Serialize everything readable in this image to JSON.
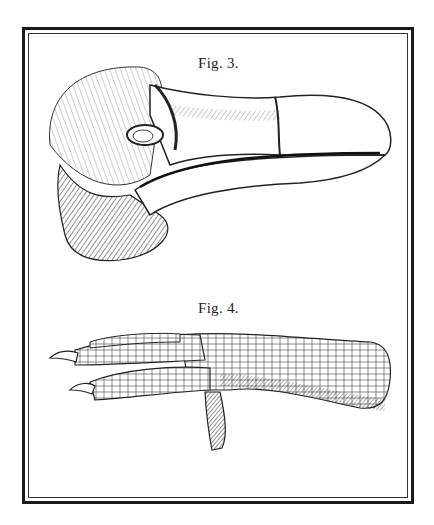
{
  "plate": {
    "figures": [
      {
        "id": "fig3",
        "caption": "Fig. 3.",
        "subject": "bird skull / head with large hooked beak (dodo), side view engraving"
      },
      {
        "id": "fig4",
        "caption": "Fig. 4.",
        "subject": "bird foot and tarsus with scaled skin and claws, side view engraving"
      }
    ]
  },
  "colors": {
    "ink": "#1a1a1a",
    "paper": "#ffffff"
  }
}
